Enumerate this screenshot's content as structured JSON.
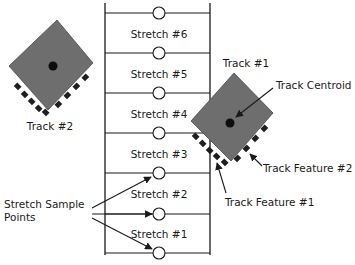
{
  "diagram": {
    "stretches": [
      {
        "label": "Stretch #6"
      },
      {
        "label": "Stretch #5"
      },
      {
        "label": "Stretch #4"
      },
      {
        "label": "Stretch #3"
      },
      {
        "label": "Stretch #2"
      },
      {
        "label": "Stretch #1"
      }
    ],
    "sample_points_label_line1": "Stretch Sample",
    "sample_points_label_line2": "Points",
    "track1": {
      "label": "Track #1",
      "centroid_label": "Track Centroid",
      "feature1_label": "Track Feature #1",
      "feature2_label": "Track Feature #2"
    },
    "track2": {
      "label": "Track #2"
    },
    "colors": {
      "track_fill": "#6e6e6e",
      "tread": "#1e1e1e",
      "line": "#1a1a1a",
      "background": "#ffffff"
    }
  }
}
